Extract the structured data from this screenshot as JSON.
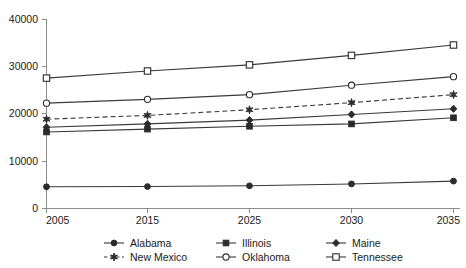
{
  "chart_data": {
    "type": "line",
    "title": "",
    "subtitle": "",
    "xlabel": "",
    "ylabel": "",
    "categories": [
      "2005",
      "2015",
      "2025",
      "2030",
      "2035"
    ],
    "x_tick_labels": [
      "2005",
      "2015",
      "2025",
      "2030",
      "2035"
    ],
    "y_tick_labels": [
      "0",
      "10000",
      "20000",
      "30000",
      "40000"
    ],
    "y_ticks": [
      0,
      10000,
      20000,
      30000,
      40000
    ],
    "ylim": [
      0,
      40000
    ],
    "grid": false,
    "legend_position": "bottom",
    "series": [
      {
        "name": "Alabama",
        "marker": "filled-circle",
        "line_style": "solid",
        "color": "#2b2b2b",
        "values": [
          4600,
          4650,
          4800,
          5200,
          5800
        ]
      },
      {
        "name": "Illinois",
        "marker": "filled-square",
        "line_style": "solid",
        "color": "#2b2b2b",
        "values": [
          16200,
          16800,
          17400,
          17900,
          19200
        ]
      },
      {
        "name": "Maine",
        "marker": "filled-diamond",
        "line_style": "solid",
        "color": "#2b2b2b",
        "values": [
          17200,
          17900,
          18700,
          19900,
          21100
        ]
      },
      {
        "name": "New Mexico",
        "marker": "star",
        "line_style": "dashed",
        "color": "#2b2b2b",
        "values": [
          18900,
          19700,
          20900,
          22400,
          24100
        ]
      },
      {
        "name": "Oklahoma",
        "marker": "open-circle",
        "line_style": "solid",
        "color": "#2b2b2b",
        "values": [
          22300,
          23100,
          24100,
          26100,
          27900
        ]
      },
      {
        "name": "Tennessee",
        "marker": "open-square",
        "line_style": "solid",
        "color": "#2b2b2b",
        "values": [
          27600,
          29100,
          30400,
          32400,
          34600
        ]
      }
    ]
  },
  "legend": {
    "entries": [
      {
        "label": "Alabama"
      },
      {
        "label": "Illinois"
      },
      {
        "label": "Maine"
      },
      {
        "label": "New Mexico"
      },
      {
        "label": "Oklahoma"
      },
      {
        "label": "Tennessee"
      }
    ]
  },
  "axis": {
    "y_40000": "40000",
    "y_30000": "30000",
    "y_20000": "20000",
    "y_10000": "10000",
    "y_0": "0",
    "x_2005": "2005",
    "x_2015": "2015",
    "x_2025": "2025",
    "x_2030": "2030",
    "x_2035": "2035"
  }
}
